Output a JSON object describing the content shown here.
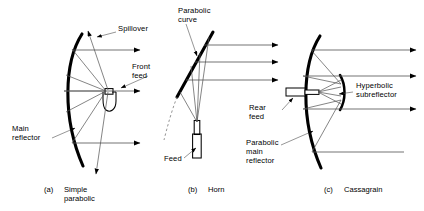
{
  "figure": {
    "title_alt": "Antenna reflector feed configurations",
    "background": "#ffffff",
    "ink": "#000000",
    "ray_color": "#555555"
  },
  "panels": [
    {
      "id": "a",
      "index_label": "(a)",
      "caption": "Simple\nparabolic",
      "labels": [
        {
          "name": "spillover",
          "text": "Spillover",
          "x": 118,
          "y": 28
        },
        {
          "name": "front-feed",
          "text": "Front\nfeed",
          "x": 132,
          "y": 66
        },
        {
          "name": "main-reflector",
          "text": "Main\nreflector",
          "x": 12,
          "y": 127
        }
      ]
    },
    {
      "id": "b",
      "index_label": "(b)",
      "caption": "Horn",
      "labels": [
        {
          "name": "parabolic-curve",
          "text": "Parabolic\ncurve",
          "x": 178,
          "y": 8
        },
        {
          "name": "feed",
          "text": "Feed",
          "x": 166,
          "y": 158
        }
      ]
    },
    {
      "id": "c",
      "index_label": "(c)",
      "caption": "Cassagrain",
      "labels": [
        {
          "name": "rear-feed",
          "text": "Rear\nfeed",
          "x": 249,
          "y": 106
        },
        {
          "name": "parabolic-main-reflector",
          "text": "Parabolic\nmain\nreflector",
          "x": 246,
          "y": 141
        },
        {
          "name": "hyperbolic-subreflector",
          "text": "Hyperbolic\nsubreflector",
          "x": 356,
          "y": 84
        }
      ]
    }
  ],
  "captions_row": [
    {
      "index": "(a)",
      "index_x": 44,
      "text": "Simple\nparabolic",
      "text_x": 64,
      "y": 186
    },
    {
      "index": "(b)",
      "index_x": 188,
      "text": "Horn",
      "text_x": 208,
      "y": 186
    },
    {
      "index": "(c)",
      "index_x": 324,
      "text": "Cassagrain",
      "text_x": 344,
      "y": 186
    }
  ]
}
